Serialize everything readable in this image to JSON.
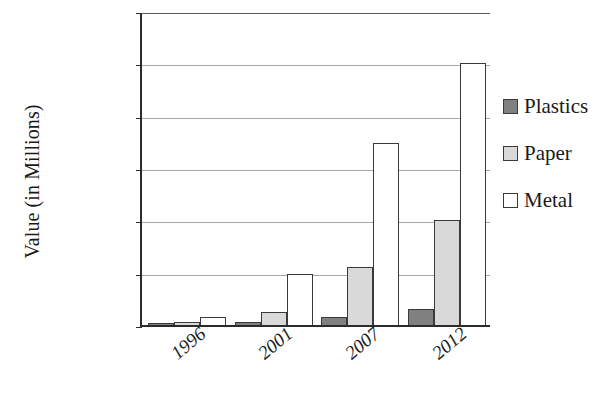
{
  "chart_data": {
    "type": "bar",
    "title": "",
    "subtitle": "",
    "xlabel": "",
    "ylabel": "Value (in Millions)",
    "categories": [
      "1996",
      "2001",
      "2007",
      "2012"
    ],
    "series": [
      {
        "name": "Plastics",
        "color": "#808080",
        "values": [
          3,
          5,
          15,
          30
        ]
      },
      {
        "name": "Paper",
        "color": "#d9d9d9",
        "values": [
          5,
          25,
          110,
          200
        ]
      },
      {
        "name": "Metal",
        "color": "#ffffff",
        "values": [
          15,
          98,
          348,
          500
        ]
      }
    ],
    "ylim": [
      0,
      600
    ],
    "ytick_values": [
      0,
      100,
      200,
      300,
      400,
      500,
      600
    ],
    "ytick_labels": [
      "$0",
      "$100",
      "$200",
      "$300",
      "$400",
      "$500",
      "$600"
    ],
    "grid": true,
    "grid_axis": "y",
    "legend_position": "right",
    "xtick_rotation": -40
  },
  "legend": {
    "items": [
      {
        "label": "Plastics",
        "swatch": "plastics-swatch"
      },
      {
        "label": "Paper",
        "swatch": "paper-swatch"
      },
      {
        "label": "Metal",
        "swatch": "metal-swatch"
      }
    ]
  }
}
